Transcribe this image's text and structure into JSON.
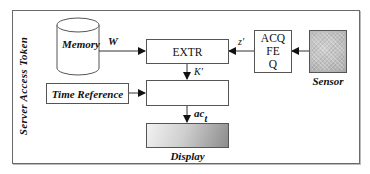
{
  "diagram": {
    "container_label": "Server Access Token",
    "nodes": {
      "memory": {
        "label": "Memory",
        "shape": "cylinder"
      },
      "extr": {
        "label": "EXTR"
      },
      "acq": {
        "lines": [
          "ACQ",
          "FE",
          "Q"
        ]
      },
      "sensor": {
        "label": "Sensor",
        "icon": "fingerprint-image-icon"
      },
      "time_reference": {
        "label": "Time Reference"
      },
      "compare": {
        "label": ""
      },
      "display": {
        "label": "Display"
      }
    },
    "edges": {
      "memory_to_extr": {
        "label": "W"
      },
      "acq_to_extr": {
        "label": "z'"
      },
      "sensor_to_acq": {
        "label": ""
      },
      "extr_to_compare": {
        "label": "K'"
      },
      "time_to_compare": {
        "label": ""
      },
      "compare_to_display": {
        "label": "ac",
        "subscript": "t"
      }
    }
  }
}
